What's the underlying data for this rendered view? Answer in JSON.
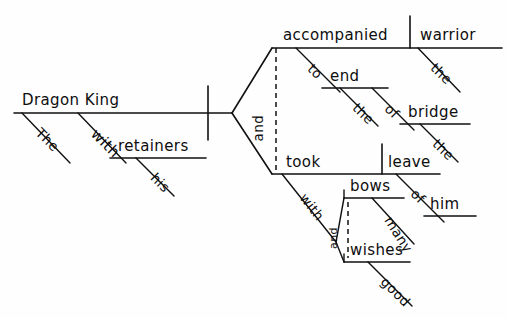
{
  "diagram": {
    "type": "reed-kellogg-sentence-diagram",
    "sentence": "The Dragon King with his retainers accompanied the warrior to the end of the bridge and took leave of him with many bows and good wishes.",
    "subject": {
      "head": "Dragon King",
      "article": "The",
      "prepositional_phrase": {
        "preposition": "with",
        "object": "retainers",
        "object_modifier": "his"
      }
    },
    "conjunction_main": "and",
    "predicate_upper": {
      "verb": "accompanied",
      "direct_object": "warrior",
      "direct_object_modifier": "the",
      "prepositional_phrase": {
        "preposition": "to",
        "object": "end",
        "object_modifier": "the",
        "nested": {
          "preposition": "of",
          "object": "bridge",
          "object_modifier": "the"
        }
      }
    },
    "predicate_lower": {
      "verb": "took",
      "direct_object": "leave",
      "prepositional_phrase_1": {
        "preposition": "of",
        "object": "him"
      },
      "prepositional_phrase_2": {
        "preposition": "with",
        "conjunction": "and",
        "object_1": "bows",
        "object_1_modifier": "many",
        "object_2": "wishes",
        "object_2_modifier": "good"
      }
    }
  },
  "words": {
    "dragon_king": "Dragon King",
    "the_subject": "The",
    "with_subject": "with",
    "retainers": "retainers",
    "his": "his",
    "and_main": "and",
    "accompanied": "accompanied",
    "warrior": "warrior",
    "the_warrior": "the",
    "to": "to",
    "end": "end",
    "the_end": "the",
    "of_bridge": "of",
    "bridge": "bridge",
    "the_bridge": "the",
    "took": "took",
    "leave": "leave",
    "of_him": "of",
    "him": "him",
    "with_lower": "with",
    "and_lower": "and",
    "bows": "bows",
    "many": "many",
    "wishes": "wishes",
    "good": "good"
  },
  "colors": {
    "ink": "#111111",
    "paper": "#fefefe"
  }
}
